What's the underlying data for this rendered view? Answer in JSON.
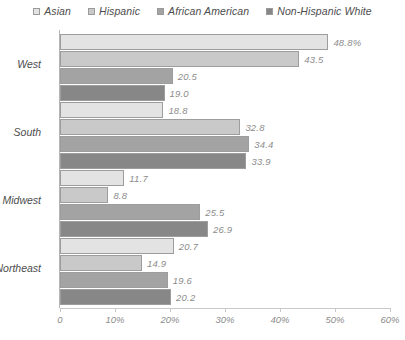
{
  "chart_data": {
    "type": "bar",
    "orientation": "horizontal",
    "title": "",
    "xlabel": "",
    "ylabel": "",
    "xlim": [
      0,
      60
    ],
    "grid": false,
    "legend_position": "top",
    "categories": [
      "West",
      "South",
      "Midwest",
      "Northeast"
    ],
    "xticklabels": [
      "0",
      "10%",
      "20%",
      "30%",
      "40%",
      "50%",
      "60%"
    ],
    "xticks": [
      0,
      10,
      20,
      30,
      40,
      50,
      60
    ],
    "series": [
      {
        "name": "Asian",
        "color": "#e3e3e3",
        "values": [
          48.8,
          18.8,
          11.7,
          20.7
        ],
        "labels": [
          "48.8%",
          "18.8",
          "11.7",
          "20.7"
        ]
      },
      {
        "name": "Hispanic",
        "color": "#c9c9c9",
        "values": [
          43.5,
          32.8,
          8.8,
          14.9
        ],
        "labels": [
          "43.5",
          "32.8",
          "8.8",
          "14.9"
        ]
      },
      {
        "name": "African American",
        "color": "#a3a3a3",
        "values": [
          20.5,
          34.4,
          25.5,
          19.6
        ],
        "labels": [
          "20.5",
          "34.4",
          "25.5",
          "19.6"
        ]
      },
      {
        "name": "Non-Hispanic White",
        "color": "#878787",
        "values": [
          19.0,
          33.9,
          26.9,
          20.2
        ],
        "labels": [
          "19.0",
          "33.9",
          "26.9",
          "20.2"
        ]
      }
    ]
  }
}
